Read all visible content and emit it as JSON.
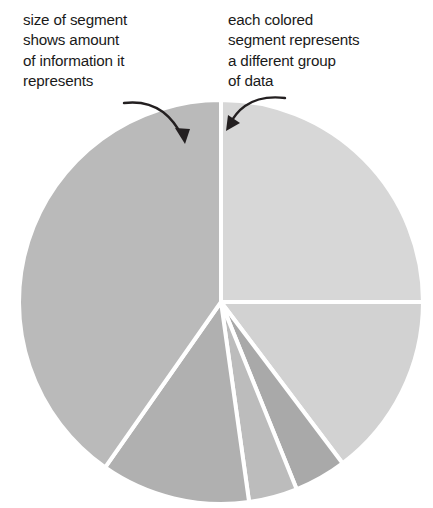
{
  "figure": {
    "background_color": "#ffffff"
  },
  "annotations": [
    {
      "id": "size-of-segment",
      "text": "size of segment\nshows amount\nof information it\nrepresents",
      "arrow": "curved-arrow-down-right",
      "points_to": "left-large-segment"
    },
    {
      "id": "each-colored-segment",
      "text": "each colored\nsegment represents\na different group\nof data",
      "arrow": "curved-arrow-down-left",
      "points_to": "top-right-segment"
    }
  ],
  "chart_data": {
    "type": "pie",
    "title": "",
    "xlabel": "",
    "ylabel": "",
    "legend": "none",
    "grid": false,
    "center": [
      221,
      302
    ],
    "radius": 202,
    "start_angle_deg": 0,
    "direction": "clockwise",
    "gap_color": "#ffffff",
    "gap_width_px": 4,
    "categories": [
      "Segment 1",
      "Segment 2",
      "Segment 3",
      "Segment 4",
      "Segment 5",
      "Segment 6"
    ],
    "values": [
      25.0,
      14.7,
      4.2,
      3.9,
      11.9,
      40.3
    ],
    "angles_deg": [
      90.0,
      53.0,
      15.0,
      14.0,
      43.0,
      145.0
    ],
    "colors": [
      "#d7d7d7",
      "#d2d2d2",
      "#a9a9a9",
      "#bcbcbc",
      "#b0b0b0",
      "#bababa"
    ],
    "slices": [
      {
        "label": "Segment 1",
        "value": 25.0,
        "start_deg": 0,
        "end_deg": 90,
        "color": "#d7d7d7"
      },
      {
        "label": "Segment 2",
        "value": 14.7,
        "start_deg": 90,
        "end_deg": 143,
        "color": "#d2d2d2"
      },
      {
        "label": "Segment 3",
        "value": 4.2,
        "start_deg": 143,
        "end_deg": 158,
        "color": "#a9a9a9"
      },
      {
        "label": "Segment 4",
        "value": 3.9,
        "start_deg": 158,
        "end_deg": 172,
        "color": "#bcbcbc"
      },
      {
        "label": "Segment 5",
        "value": 11.9,
        "start_deg": 172,
        "end_deg": 215,
        "color": "#b0b0b0"
      },
      {
        "label": "Segment 6",
        "value": 40.3,
        "start_deg": 215,
        "end_deg": 360,
        "color": "#bababa"
      }
    ]
  }
}
